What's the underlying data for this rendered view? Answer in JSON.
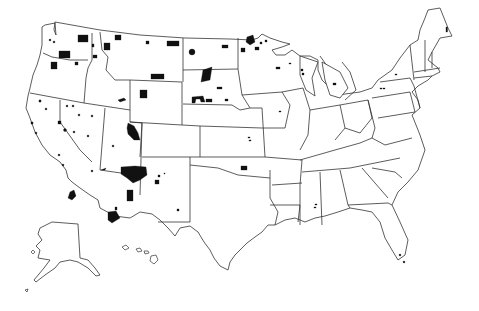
{
  "map": {
    "title": "",
    "subject": "United States with Indian reservations",
    "colors": {
      "background": "#ffffff",
      "state_outline": "#333333",
      "reservation_fill": "#111111"
    },
    "legend": null,
    "regions_shown": [
      "Contiguous United States",
      "Alaska (inset)",
      "Hawaii (inset)"
    ],
    "reservation_marker_count_approx": 80
  }
}
